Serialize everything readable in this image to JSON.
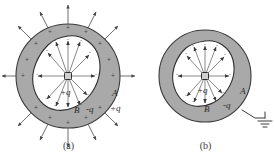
{
  "figure": {
    "type": "physics-diagram",
    "colors": {
      "shell_fill": "#a9a9a9",
      "shell_stroke": "#3a3a3a",
      "cavity_fill": "#ffffff",
      "cavity_stroke": "#2e2e2e",
      "field_line": "#555555",
      "text": "#2b2b2b",
      "background": "#ffffff"
    }
  },
  "panels": [
    {
      "id": "a",
      "caption": "(a)",
      "grounded": false,
      "center_charge": {
        "label": "+q",
        "sign": "+",
        "icon": "point-charge-square"
      },
      "labels": {
        "inner_shell": "B",
        "inner_surface_charge": "-q",
        "outer_shell": "A",
        "outer_surface_charge": "+q"
      },
      "inner_surface_signs": "-",
      "inner_surface_sign_count": 12,
      "outer_surface_signs": "+",
      "outer_surface_sign_count": 14,
      "inner_field_lines": 12,
      "outer_field_lines": 12,
      "has_external_field": true,
      "has_ground_symbol": false
    },
    {
      "id": "b",
      "caption": "(b)",
      "grounded": true,
      "center_charge": {
        "label": "+q",
        "sign": "+",
        "icon": "point-charge-square"
      },
      "labels": {
        "inner_shell": "B",
        "inner_surface_charge": "-q",
        "outer_shell": "A",
        "outer_surface_charge": ""
      },
      "inner_surface_signs": "-",
      "inner_surface_sign_count": 12,
      "outer_surface_signs": "",
      "outer_surface_sign_count": 0,
      "inner_field_lines": 12,
      "outer_field_lines": 0,
      "has_external_field": false,
      "has_ground_symbol": true,
      "ground_symbol": "earth-ground"
    }
  ]
}
